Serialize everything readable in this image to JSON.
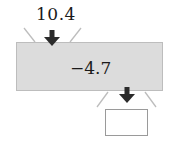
{
  "diagram": {
    "type": "function-machine",
    "input_value": "10.4",
    "operation": "−4.7",
    "output_value": "",
    "colors": {
      "machine_fill": "#dcdcdc",
      "arrow": "#2b2b2b",
      "funnel_lines": "#bdbdbd"
    }
  }
}
